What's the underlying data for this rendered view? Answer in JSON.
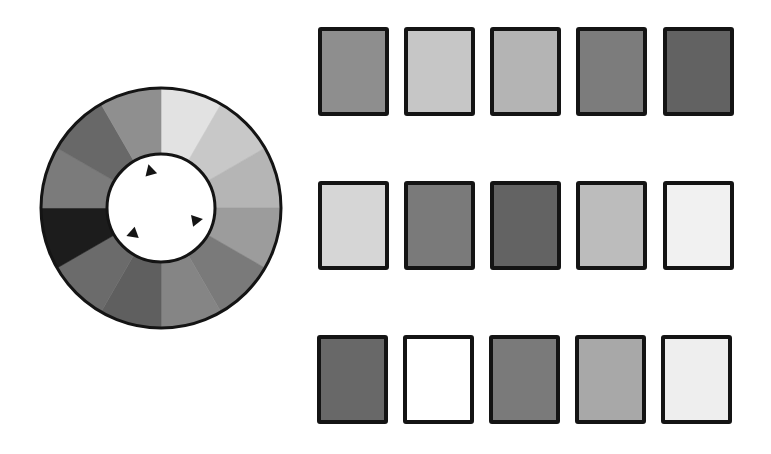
{
  "wheel": {
    "center": [
      161,
      208
    ],
    "outer_radius": 120,
    "inner_radius": 54,
    "outline_color": "#141414",
    "hub_color": "#ffffff",
    "segments": [
      {
        "index": 0,
        "start_deg": 0,
        "end_deg": 30,
        "color": "#e2e2e2"
      },
      {
        "index": 1,
        "start_deg": 30,
        "end_deg": 60,
        "color": "#c8c8c8"
      },
      {
        "index": 2,
        "start_deg": 60,
        "end_deg": 90,
        "color": "#b5b5b5"
      },
      {
        "index": 3,
        "start_deg": 90,
        "end_deg": 120,
        "color": "#9c9c9c"
      },
      {
        "index": 4,
        "start_deg": 120,
        "end_deg": 150,
        "color": "#7a7a7a"
      },
      {
        "index": 5,
        "start_deg": 150,
        "end_deg": 180,
        "color": "#858585"
      },
      {
        "index": 6,
        "start_deg": 180,
        "end_deg": 210,
        "color": "#5f5f5f"
      },
      {
        "index": 7,
        "start_deg": 210,
        "end_deg": 240,
        "color": "#6b6b6b"
      },
      {
        "index": 8,
        "start_deg": 240,
        "end_deg": 270,
        "color": "#1c1c1c"
      },
      {
        "index": 9,
        "start_deg": 270,
        "end_deg": 300,
        "color": "#7b7b7b"
      },
      {
        "index": 10,
        "start_deg": 300,
        "end_deg": 330,
        "color": "#686868"
      },
      {
        "index": 11,
        "start_deg": 330,
        "end_deg": 360,
        "color": "#8f8f8f"
      }
    ],
    "markers": [
      {
        "name": "marker-top",
        "x": 150,
        "y": 170,
        "rotation": -15
      },
      {
        "name": "marker-right",
        "x": 197,
        "y": 220,
        "rotation": 80
      },
      {
        "name": "marker-left",
        "x": 132,
        "y": 234,
        "rotation": -110
      }
    ]
  },
  "swatch_grid": {
    "rows": [
      {
        "y": 27,
        "swatches": [
          {
            "x": 318,
            "color": "#8e8e8e"
          },
          {
            "x": 404,
            "color": "#c6c6c6"
          },
          {
            "x": 490,
            "color": "#b4b4b4"
          },
          {
            "x": 576,
            "color": "#7c7c7c"
          },
          {
            "x": 663,
            "color": "#626262"
          }
        ]
      },
      {
        "y": 181,
        "swatches": [
          {
            "x": 318,
            "color": "#d6d6d6"
          },
          {
            "x": 404,
            "color": "#7a7a7a"
          },
          {
            "x": 490,
            "color": "#636363"
          },
          {
            "x": 576,
            "color": "#bcbcbc"
          },
          {
            "x": 663,
            "color": "#f1f1f1"
          }
        ]
      },
      {
        "y": 335,
        "swatches": [
          {
            "x": 317,
            "color": "#686868"
          },
          {
            "x": 403,
            "color": "#ffffff"
          },
          {
            "x": 489,
            "color": "#7a7a7a"
          },
          {
            "x": 575,
            "color": "#a8a8a8"
          },
          {
            "x": 661,
            "color": "#eeeeee"
          }
        ]
      }
    ]
  }
}
